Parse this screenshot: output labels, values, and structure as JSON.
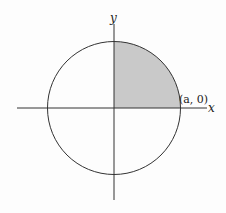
{
  "diagram": {
    "axes": {
      "x_label": "x",
      "y_label": "y"
    },
    "circle": {
      "center": [
        0,
        0
      ],
      "radius_label": "a"
    },
    "point_label": "(a, 0)",
    "shaded_region": "first quadrant quarter disk",
    "colors": {
      "stroke": "#333333",
      "fill": "#c9c9c9",
      "background": "#fdfdfd"
    }
  }
}
